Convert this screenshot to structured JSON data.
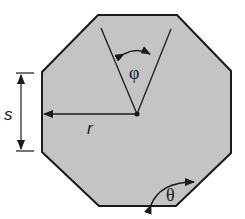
{
  "diagram": {
    "shape": "regular-octagon",
    "fill_color": "#c4c4c4",
    "stroke_color": "#1a1a1a",
    "labels": {
      "side_length": "s",
      "radius": "r",
      "central_angle": "φ",
      "interior_angle": "θ"
    }
  }
}
